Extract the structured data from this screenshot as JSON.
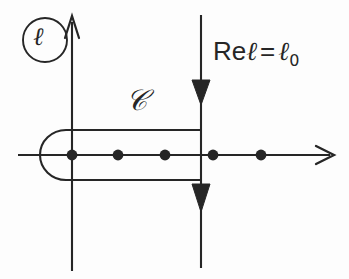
{
  "figure": {
    "background_color": "#fdfdfd",
    "ink_color": "#262626",
    "labels": {
      "axis_symbol": "ℓ",
      "contour_symbol": "𝒞",
      "reline_prefix": "Re",
      "reline_symbol": "ℓ",
      "reline_equals": "=",
      "reline_value_symbol": "ℓ",
      "reline_value_subscript": "0"
    },
    "axes": {
      "real_axis": {
        "name": "real-axis",
        "y": 155,
        "x_start": 18,
        "x_end": 333,
        "arrow": "right-open-arrow"
      },
      "imaginary_axis": {
        "name": "imaginary-axis",
        "x": 72,
        "y_start": 17,
        "y_end": 271,
        "arrow": "up-open-arrow"
      }
    },
    "poles": {
      "name": "pole-markers",
      "count": 5,
      "radius": 5,
      "y": 155,
      "x_positions": [
        72,
        118,
        165,
        213,
        261
      ]
    },
    "contour": {
      "name": "contour-path",
      "turn_x": 201,
      "upper_y": 130,
      "lower_y": 180,
      "loop_left_x": 42,
      "loop_center_x": 72,
      "arrowheads": [
        {
          "name": "contour-upper-arrowhead",
          "x": 201,
          "y": 92,
          "direction": "down"
        },
        {
          "name": "contour-lower-arrowhead",
          "x": 201,
          "y": 213,
          "direction": "down"
        }
      ]
    },
    "reline": {
      "name": "re-l-equals-l0-line",
      "x": 201,
      "y_start": 15,
      "y_end": 268
    },
    "circle_badge": {
      "name": "axis-label-circle",
      "cx": 45,
      "cy": 40,
      "r": 22
    }
  }
}
